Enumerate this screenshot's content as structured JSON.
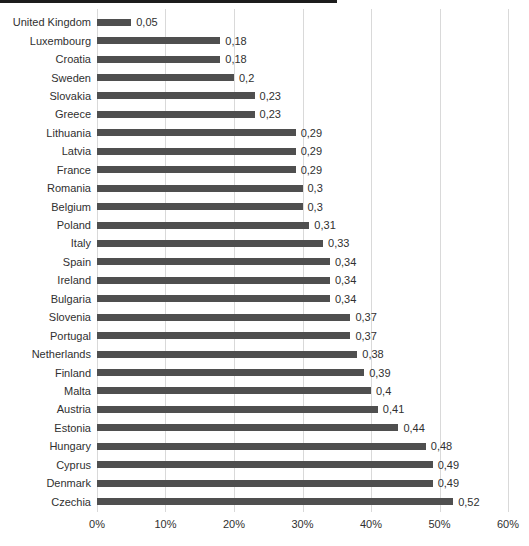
{
  "chart_data": {
    "type": "bar",
    "orientation": "horizontal",
    "title": "",
    "xlabel": "",
    "ylabel": "",
    "xlim": [
      0,
      0.6
    ],
    "grid": "vertical",
    "legend": "none",
    "categories": [
      "United Kingdom",
      "Luxembourg",
      "Croatia",
      "Sweden",
      "Slovakia",
      "Greece",
      "Lithuania",
      "Latvia",
      "France",
      "Romania",
      "Belgium",
      "Poland",
      "Italy",
      "Spain",
      "Ireland",
      "Bulgaria",
      "Slovenia",
      "Portugal",
      "Netherlands",
      "Finland",
      "Malta",
      "Austria",
      "Estonia",
      "Hungary",
      "Cyprus",
      "Denmark",
      "Czechia"
    ],
    "values": [
      0.05,
      0.18,
      0.18,
      0.2,
      0.23,
      0.23,
      0.29,
      0.29,
      0.29,
      0.3,
      0.3,
      0.31,
      0.33,
      0.34,
      0.34,
      0.34,
      0.37,
      0.37,
      0.38,
      0.39,
      0.4,
      0.41,
      0.44,
      0.48,
      0.49,
      0.49,
      0.52
    ],
    "value_labels": [
      "0,05",
      "0,18",
      "0,18",
      "0,2",
      "0,23",
      "0,23",
      "0,29",
      "0,29",
      "0,29",
      "0,3",
      "0,3",
      "0,31",
      "0,33",
      "0,34",
      "0,34",
      "0,34",
      "0,37",
      "0,37",
      "0,38",
      "0,39",
      "0,4",
      "0,41",
      "0,44",
      "0,48",
      "0,49",
      "0,49",
      "0,52"
    ],
    "x_ticks": [
      "0%",
      "10%",
      "20%",
      "30%",
      "40%",
      "50%",
      "60%"
    ],
    "colors": {
      "bar": "#4f4f4f",
      "gridline": "#d9d9d9",
      "text": "#303030",
      "top_rule": "#1c1c1c",
      "background": "#ffffff"
    }
  }
}
